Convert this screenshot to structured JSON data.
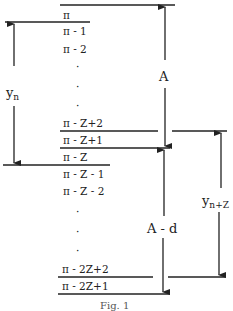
{
  "diagram": {
    "stack_items": [
      "π",
      "π - 1",
      "π - 2",
      "·",
      "·",
      "π - Z+2",
      "π - Z+1",
      "π - Z",
      "π - Z - 1",
      "π - Z - 2",
      "·",
      "·",
      "·",
      "π - 2Z+2",
      "π - 2Z+1"
    ],
    "labels": {
      "y_n_base": "y",
      "y_n_sub": "n",
      "A": "A",
      "A_minus_d": "A - d",
      "y_n2_base": "y",
      "y_n2_sub": "n+Z"
    },
    "caption": "Fig. 1"
  }
}
